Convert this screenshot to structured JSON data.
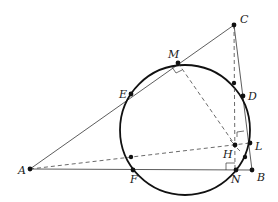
{
  "diagram": {
    "type": "geometry",
    "points": {
      "A": {
        "label": "A",
        "x": 30,
        "y": 169
      },
      "B": {
        "label": "B",
        "x": 252,
        "y": 170
      },
      "C": {
        "label": "C",
        "x": 234,
        "y": 25
      },
      "M": {
        "label": "M",
        "x": 178,
        "y": 63
      },
      "E": {
        "label": "E",
        "x": 131,
        "y": 94
      },
      "D": {
        "label": "D",
        "x": 243,
        "y": 96
      },
      "F": {
        "label": "F",
        "x": 133,
        "y": 170
      },
      "N": {
        "label": "N",
        "x": 236,
        "y": 170
      },
      "H": {
        "label": "H",
        "x": 235,
        "y": 145
      },
      "L": {
        "label": "L",
        "x": 250,
        "y": 143
      }
    },
    "circle": {
      "cx": 185,
      "cy": 130,
      "r": 65
    },
    "labels": [
      "A",
      "B",
      "C",
      "D",
      "E",
      "F",
      "H",
      "L",
      "M",
      "N"
    ]
  }
}
